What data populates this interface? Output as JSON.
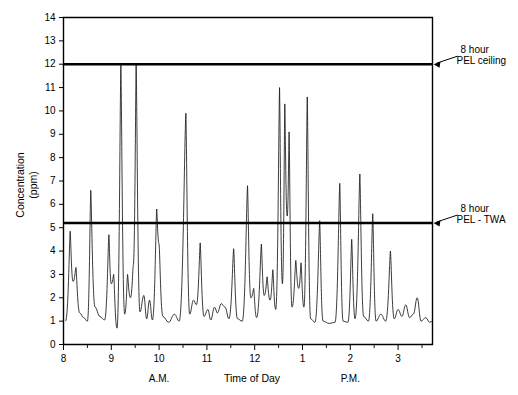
{
  "chart_data": {
    "type": "line",
    "title": "",
    "subtitle": "",
    "xlabel": "Time of Day",
    "ylabel": "Concentration (ppm)",
    "ylabel_line1": "Concentration",
    "ylabel_line2": "(ppm)",
    "xlim": [
      8.0,
      15.72
    ],
    "ylim": [
      0,
      14
    ],
    "grid": false,
    "legend_position": "none",
    "y_ticks": [
      0,
      1,
      2,
      3,
      4,
      5,
      6,
      7,
      8,
      9,
      10,
      11,
      12,
      13,
      14
    ],
    "y_tick_labels": [
      "0",
      "1",
      "2",
      "3",
      "4",
      "5",
      "6",
      "7",
      "8",
      "9",
      "10",
      "11",
      "12",
      "13",
      "14"
    ],
    "x_ticks": [
      8,
      9,
      10,
      11,
      12,
      13,
      14,
      15
    ],
    "x_tick_labels": [
      "8",
      "9",
      "10",
      "11",
      "12",
      "1",
      "2",
      "3"
    ],
    "x_minor_ticks": [
      8.5,
      9.5,
      10.5,
      11.5,
      12.5,
      13.5,
      14.5,
      15.5
    ],
    "period_labels": [
      {
        "text": "A.M.",
        "x": 10.0
      },
      {
        "text": "P.M.",
        "x": 14.0
      }
    ],
    "reference_lines": [
      {
        "name": "pel-ceiling",
        "value": 12.0,
        "label_line1": "8 hour",
        "label_line2": "PEL ceiling",
        "color": "#000000"
      },
      {
        "name": "pel-twa",
        "value": 5.2,
        "label_line1": "8 hour",
        "label_line2": "PEL - TWA",
        "color": "#000000"
      }
    ],
    "series": [
      {
        "name": "Concentration",
        "color": "#1a1a1a",
        "baseline": 1.0,
        "peaks": [
          {
            "t": 8.05,
            "v": 1.0
          },
          {
            "t": 8.14,
            "v": 4.85
          },
          {
            "t": 8.2,
            "v": 2.7
          },
          {
            "t": 8.26,
            "v": 3.3
          },
          {
            "t": 8.34,
            "v": 1.35
          },
          {
            "t": 8.42,
            "v": 1.15
          },
          {
            "t": 8.5,
            "v": 1.0
          },
          {
            "t": 8.57,
            "v": 6.6
          },
          {
            "t": 8.66,
            "v": 1.6
          },
          {
            "t": 8.76,
            "v": 1.2
          },
          {
            "t": 8.86,
            "v": 1.05
          },
          {
            "t": 8.95,
            "v": 4.7
          },
          {
            "t": 9.0,
            "v": 2.6
          },
          {
            "t": 9.05,
            "v": 3.0
          },
          {
            "t": 9.12,
            "v": 0.7
          },
          {
            "t": 9.2,
            "v": 11.95
          },
          {
            "t": 9.28,
            "v": 1.3
          },
          {
            "t": 9.34,
            "v": 3.0
          },
          {
            "t": 9.4,
            "v": 2.0
          },
          {
            "t": 9.46,
            "v": 3.4
          },
          {
            "t": 9.52,
            "v": 12.0
          },
          {
            "t": 9.6,
            "v": 1.4
          },
          {
            "t": 9.68,
            "v": 2.1
          },
          {
            "t": 9.74,
            "v": 1.1
          },
          {
            "t": 9.8,
            "v": 1.9
          },
          {
            "t": 9.86,
            "v": 1.05
          },
          {
            "t": 9.95,
            "v": 5.8
          },
          {
            "t": 10.0,
            "v": 4.3
          },
          {
            "t": 10.08,
            "v": 1.2
          },
          {
            "t": 10.2,
            "v": 0.95
          },
          {
            "t": 10.32,
            "v": 1.3
          },
          {
            "t": 10.42,
            "v": 1.0
          },
          {
            "t": 10.56,
            "v": 9.9
          },
          {
            "t": 10.64,
            "v": 1.3
          },
          {
            "t": 10.72,
            "v": 1.9
          },
          {
            "t": 10.78,
            "v": 1.7
          },
          {
            "t": 10.86,
            "v": 4.35
          },
          {
            "t": 10.94,
            "v": 1.2
          },
          {
            "t": 11.02,
            "v": 1.5
          },
          {
            "t": 11.08,
            "v": 1.05
          },
          {
            "t": 11.16,
            "v": 1.6
          },
          {
            "t": 11.22,
            "v": 1.35
          },
          {
            "t": 11.3,
            "v": 1.75
          },
          {
            "t": 11.38,
            "v": 1.6
          },
          {
            "t": 11.46,
            "v": 1.1
          },
          {
            "t": 11.56,
            "v": 4.1
          },
          {
            "t": 11.64,
            "v": 1.1
          },
          {
            "t": 11.74,
            "v": 1.0
          },
          {
            "t": 11.85,
            "v": 6.8
          },
          {
            "t": 11.92,
            "v": 2.0
          },
          {
            "t": 11.98,
            "v": 2.4
          },
          {
            "t": 12.04,
            "v": 1.15
          },
          {
            "t": 12.14,
            "v": 4.3
          },
          {
            "t": 12.2,
            "v": 2.1
          },
          {
            "t": 12.26,
            "v": 2.9
          },
          {
            "t": 12.32,
            "v": 1.9
          },
          {
            "t": 12.38,
            "v": 3.2
          },
          {
            "t": 12.44,
            "v": 1.5
          },
          {
            "t": 12.52,
            "v": 11.0
          },
          {
            "t": 12.58,
            "v": 2.6
          },
          {
            "t": 12.63,
            "v": 10.3
          },
          {
            "t": 12.68,
            "v": 5.5
          },
          {
            "t": 12.72,
            "v": 9.1
          },
          {
            "t": 12.78,
            "v": 1.6
          },
          {
            "t": 12.86,
            "v": 3.6
          },
          {
            "t": 12.92,
            "v": 2.4
          },
          {
            "t": 12.97,
            "v": 3.5
          },
          {
            "t": 13.03,
            "v": 1.6
          },
          {
            "t": 13.1,
            "v": 10.6
          },
          {
            "t": 13.17,
            "v": 1.1
          },
          {
            "t": 13.26,
            "v": 0.95
          },
          {
            "t": 13.36,
            "v": 5.3
          },
          {
            "t": 13.43,
            "v": 1.0
          },
          {
            "t": 13.56,
            "v": 0.9
          },
          {
            "t": 13.68,
            "v": 0.95
          },
          {
            "t": 13.78,
            "v": 6.9
          },
          {
            "t": 13.85,
            "v": 1.0
          },
          {
            "t": 13.95,
            "v": 0.95
          },
          {
            "t": 14.03,
            "v": 4.5
          },
          {
            "t": 14.1,
            "v": 1.1
          },
          {
            "t": 14.2,
            "v": 7.3
          },
          {
            "t": 14.28,
            "v": 1.2
          },
          {
            "t": 14.38,
            "v": 1.0
          },
          {
            "t": 14.47,
            "v": 5.6
          },
          {
            "t": 14.54,
            "v": 1.0
          },
          {
            "t": 14.64,
            "v": 1.3
          },
          {
            "t": 14.74,
            "v": 1.0
          },
          {
            "t": 14.84,
            "v": 4.0
          },
          {
            "t": 14.92,
            "v": 1.1
          },
          {
            "t": 15.0,
            "v": 1.5
          },
          {
            "t": 15.08,
            "v": 1.2
          },
          {
            "t": 15.16,
            "v": 1.7
          },
          {
            "t": 15.24,
            "v": 1.15
          },
          {
            "t": 15.32,
            "v": 1.3
          },
          {
            "t": 15.4,
            "v": 2.0
          },
          {
            "t": 15.48,
            "v": 1.0
          },
          {
            "t": 15.58,
            "v": 1.15
          },
          {
            "t": 15.66,
            "v": 0.95
          },
          {
            "t": 15.72,
            "v": 1.0
          }
        ]
      }
    ]
  }
}
